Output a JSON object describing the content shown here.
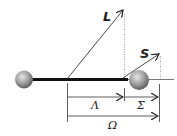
{
  "diagram": {
    "labels": {
      "L": "L",
      "S": "S",
      "Lambda": "Λ",
      "Sigma": "Σ",
      "Omega": "Ω"
    },
    "colors": {
      "line": "#111111",
      "arrow": "#333333",
      "dotted": "#888888",
      "sphere_light": "#d8d8d8",
      "sphere_dark": "#6e6e6e"
    }
  }
}
